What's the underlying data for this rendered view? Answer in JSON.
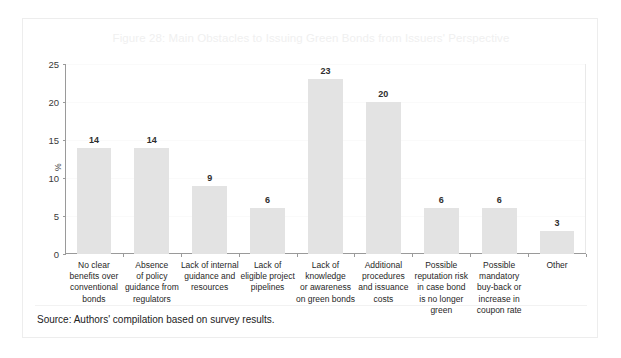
{
  "figure": {
    "title": "Figure 28: Main Obstacles to Issuing Green Bonds from Issuers' Perspective",
    "source_note": "Source: Authors' compilation based on survey results.",
    "title_color": "#f0f0f0",
    "bar_color": "#e3e3e3",
    "axis_color": "#9a9a9a"
  },
  "chart_data": {
    "type": "bar",
    "title": "Figure 28: Main Obstacles to Issuing Green Bonds from Issuers' Perspective",
    "xlabel": "",
    "ylabel": "%",
    "ylim": [
      0,
      25
    ],
    "yticks": [
      0,
      5,
      10,
      15,
      20,
      25
    ],
    "grid": false,
    "legend": "none",
    "categories": [
      "No clear benefits over conventional bonds",
      "Absence of policy guidance from regulators",
      "Lack of internal guidance and resources",
      "Lack of eligible project pipelines",
      "Lack of knowledge or awareness on green bonds",
      "Additional procedures and issuance costs",
      "Possible reputation risk in case bond is no longer green",
      "Possible mandatory buy-back or increase in coupon rate",
      "Other"
    ],
    "category_lines": [
      [
        "No clear",
        "benefits over",
        "conventional",
        "bonds"
      ],
      [
        "Absence",
        "of policy",
        "guidance from",
        "regulators"
      ],
      [
        "Lack of internal",
        "guidance and",
        "resources"
      ],
      [
        "Lack of",
        "eligible project",
        "pipelines"
      ],
      [
        "Lack of",
        "knowledge",
        "or awareness",
        "on green bonds"
      ],
      [
        "Additional",
        "procedures",
        "and issuance",
        "costs"
      ],
      [
        "Possible",
        "reputation risk",
        "in case bond",
        "is no longer",
        "green"
      ],
      [
        "Possible",
        "mandatory",
        "buy-back or",
        "increase in",
        "coupon rate"
      ],
      [
        "Other"
      ]
    ],
    "values": [
      14,
      14,
      9,
      6,
      23,
      20,
      6,
      6,
      3
    ]
  }
}
